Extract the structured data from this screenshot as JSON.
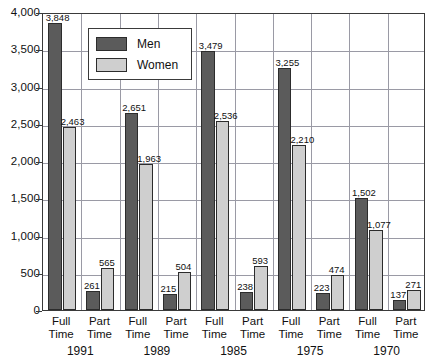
{
  "chart_data": {
    "type": "bar",
    "title": "",
    "subtitle": "",
    "xlabel": "",
    "ylabel": "",
    "ylim": [
      0,
      4000
    ],
    "ytick_labels": [
      "0",
      "500",
      "1,000",
      "1,500",
      "2,000",
      "2,500",
      "3,000",
      "3,500",
      "4,000"
    ],
    "ytick_values": [
      0,
      500,
      1000,
      1500,
      2000,
      2500,
      3000,
      3500,
      4000
    ],
    "grid": true,
    "legend_position": "top-left-inside",
    "legend": [
      "Men",
      "Women"
    ],
    "colors": {
      "men": "#5b5b5b",
      "women": "#cfcfcf",
      "axis": "#3a3a3a",
      "grid": "#9a9aa5",
      "background": "#ffffff"
    },
    "group_labels": [
      "Full\nTime",
      "Part\nTime"
    ],
    "categories": [
      "1991 Full Time",
      "1991 Part Time",
      "1989 Full Time",
      "1989 Part Time",
      "1985 Full Time",
      "1985 Part Time",
      "1975 Full Time",
      "1975 Part Time",
      "1970 Full Time",
      "1970 Part Time"
    ],
    "years": [
      "1991",
      "1989",
      "1985",
      "1975",
      "1970"
    ],
    "series": [
      {
        "name": "Men",
        "values": [
          3848,
          261,
          2651,
          215,
          3479,
          238,
          3255,
          223,
          1502,
          137
        ],
        "value_labels": [
          "3,848",
          "261",
          "2,651",
          "215",
          "3,479",
          "238",
          "3,255",
          "223",
          "1,502",
          "137"
        ]
      },
      {
        "name": "Women",
        "values": [
          2463,
          565,
          1963,
          504,
          2536,
          593,
          2210,
          474,
          1077,
          271
        ],
        "value_labels": [
          "2,463",
          "565",
          "1,963",
          "504",
          "2,536",
          "593",
          "2,210",
          "474",
          "1,077",
          "271"
        ]
      }
    ],
    "groups": [
      {
        "year": "1991",
        "bars": [
          {
            "work": "Full\nTime",
            "men_label": "3,848",
            "men": 3848,
            "women_label": "2,463",
            "women": 2463
          },
          {
            "work": "Part\nTime",
            "men_label": "261",
            "men": 261,
            "women_label": "565",
            "women": 565
          }
        ]
      },
      {
        "year": "1989",
        "bars": [
          {
            "work": "Full\nTime",
            "men_label": "2,651",
            "men": 2651,
            "women_label": "1,963",
            "women": 1963
          },
          {
            "work": "Part\nTime",
            "men_label": "215",
            "men": 215,
            "women_label": "504",
            "women": 504
          }
        ]
      },
      {
        "year": "1985",
        "bars": [
          {
            "work": "Full\nTime",
            "men_label": "3,479",
            "men": 3479,
            "women_label": "2,536",
            "women": 2536
          },
          {
            "work": "Part\nTime",
            "men_label": "238",
            "men": 238,
            "women_label": "593",
            "women": 593
          }
        ]
      },
      {
        "year": "1975",
        "bars": [
          {
            "work": "Full\nTime",
            "men_label": "3,255",
            "men": 3255,
            "women_label": "2,210",
            "women": 2210
          },
          {
            "work": "Part\nTime",
            "men_label": "223",
            "men": 223,
            "women_label": "474",
            "women": 474
          }
        ]
      },
      {
        "year": "1970",
        "bars": [
          {
            "work": "Full\nTime",
            "men_label": "1,502",
            "men": 1502,
            "women_label": "1,077",
            "women": 1077
          },
          {
            "work": "Part\nTime",
            "men_label": "137",
            "men": 137,
            "women_label": "271",
            "women": 271
          }
        ]
      }
    ]
  }
}
